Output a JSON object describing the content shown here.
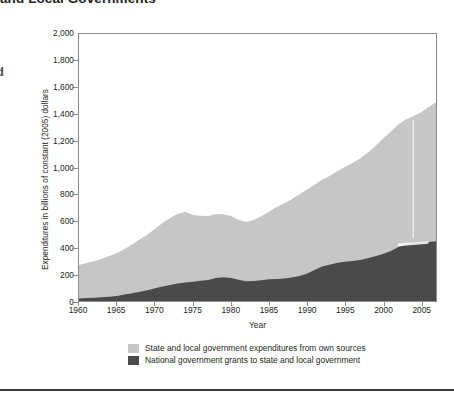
{
  "figure": {
    "title_clipped": "and Local Governments",
    "left_margin_stub": "d",
    "ylabel": "Expenditures in billions of constant (2005) dollars",
    "xlabel": "Year"
  },
  "colors": {
    "light_band": "#c6c6c6",
    "dark_band": "#4a4a4a",
    "axis": "#8c8c8c",
    "text": "#231f20",
    "footer_rule": "#3b3b3b",
    "artifact": "#ffffff"
  },
  "legend": {
    "items": [
      {
        "label": "State and local government expenditures from own sources",
        "color": "#c6c6c6"
      },
      {
        "label": "National government grants to state and local government",
        "color": "#4a4a4a"
      }
    ]
  },
  "axes": {
    "y_ticks": [
      "0",
      "200",
      "400",
      "600",
      "800",
      "1,000",
      "1,200",
      "1,400",
      "1,600",
      "1,800",
      "2,000"
    ],
    "x_ticks": [
      "1960",
      "1965",
      "1970",
      "1975",
      "1980",
      "1985",
      "1990",
      "1995",
      "2000",
      "2005"
    ]
  },
  "chart_data": {
    "type": "area",
    "title": "and Local Governments",
    "xlabel": "Year",
    "ylabel": "Expenditures in billions of constant (2005) dollars",
    "xlim": [
      1960,
      2007
    ],
    "ylim": [
      0,
      2000
    ],
    "ytick_values": [
      0,
      200,
      400,
      600,
      800,
      1000,
      1200,
      1400,
      1600,
      1800,
      2000
    ],
    "xtick_values": [
      1960,
      1965,
      1970,
      1975,
      1980,
      1985,
      1990,
      1995,
      2000,
      2005
    ],
    "grid": false,
    "legend_position": "bottom",
    "stacked": true,
    "x": [
      1960,
      1961,
      1962,
      1963,
      1964,
      1965,
      1966,
      1967,
      1968,
      1969,
      1970,
      1971,
      1972,
      1973,
      1974,
      1975,
      1976,
      1977,
      1978,
      1979,
      1980,
      1981,
      1982,
      1983,
      1984,
      1985,
      1986,
      1987,
      1988,
      1989,
      1990,
      1991,
      1992,
      1993,
      1994,
      1995,
      1996,
      1997,
      1998,
      1999,
      2000,
      2001,
      2002,
      2003,
      2004,
      2005,
      2006,
      2007
    ],
    "series": [
      {
        "name": "National government grants to state and local government",
        "values": [
          18,
          22,
          25,
          28,
          32,
          38,
          48,
          58,
          70,
          80,
          95,
          108,
          120,
          132,
          138,
          145,
          152,
          158,
          172,
          178,
          172,
          160,
          148,
          150,
          156,
          162,
          164,
          168,
          176,
          188,
          205,
          232,
          258,
          272,
          286,
          294,
          300,
          308,
          320,
          336,
          352,
          372,
          402,
          424,
          436,
          440,
          442,
          448
        ]
      },
      {
        "name": "State and local government expenditures from own sources",
        "values": [
          252,
          262,
          272,
          288,
          306,
          322,
          342,
          366,
          392,
          416,
          446,
          476,
          502,
          522,
          530,
          500,
          486,
          478,
          480,
          472,
          464,
          448,
          444,
          456,
          478,
          506,
          540,
          562,
          586,
          610,
          630,
          638,
          650,
          664,
          686,
          710,
          734,
          760,
          790,
          824,
          864,
          894,
          918,
          936,
          948,
          972,
          1010,
          1040
        ]
      }
    ],
    "totals": [
      270,
      284,
      297,
      316,
      338,
      360,
      390,
      424,
      462,
      496,
      541,
      584,
      622,
      654,
      668,
      645,
      638,
      636,
      652,
      650,
      636,
      608,
      592,
      606,
      634,
      668,
      704,
      730,
      762,
      798,
      835,
      870,
      908,
      936,
      972,
      1004,
      1034,
      1068,
      1110,
      1160,
      1216,
      1266,
      1320,
      1360,
      1384,
      1412,
      1452,
      1488
    ],
    "artifacts": [
      {
        "type": "vertical-line",
        "x": 2004,
        "color": "#ffffff",
        "note": "scan artifact"
      },
      {
        "type": "horizontal-streak",
        "x_range": [
          2002,
          2006
        ],
        "y": 430,
        "color": "#ffffff",
        "note": "scan artifact"
      }
    ]
  }
}
